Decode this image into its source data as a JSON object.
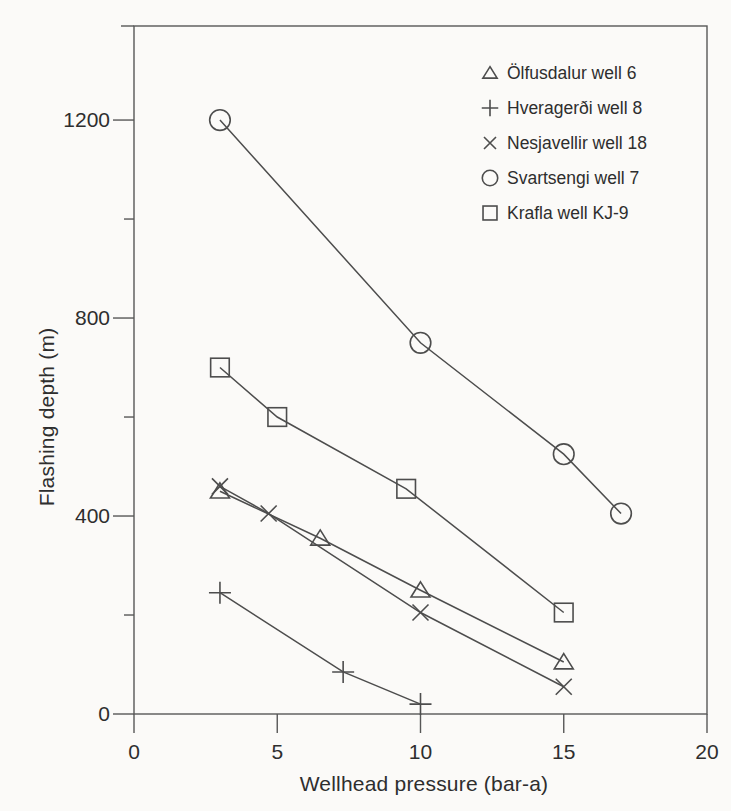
{
  "figure": {
    "background": "#fbfaf8"
  },
  "chart_data": {
    "type": "line",
    "title": "",
    "xlabel": "Wellhead pressure (bar-a)",
    "ylabel": "Flashing depth (m)",
    "xlim": [
      0,
      20
    ],
    "ylim": [
      0,
      1390
    ],
    "x_ticks": [
      0,
      5,
      10,
      15,
      20
    ],
    "y_ticks_major": [
      0,
      400,
      800,
      1200
    ],
    "y_ticks_minor": [
      200,
      600,
      1000
    ],
    "grid": false,
    "legend_position": "top-right",
    "series": [
      {
        "name": "Ölfusdalur well 6",
        "marker": "triangle",
        "points": [
          [
            3,
            450
          ],
          [
            6.5,
            355
          ],
          [
            10,
            250
          ],
          [
            15,
            105
          ]
        ]
      },
      {
        "name": "Hveragerði well 8",
        "marker": "plus",
        "points": [
          [
            3,
            245
          ],
          [
            7.3,
            85
          ],
          [
            10,
            20
          ]
        ]
      },
      {
        "name": "Nesjavellir well 18",
        "marker": "x",
        "points": [
          [
            3,
            460
          ],
          [
            4.7,
            405
          ],
          [
            10,
            205
          ],
          [
            15,
            55
          ]
        ]
      },
      {
        "name": "Svartsengi well 7",
        "marker": "circle",
        "points": [
          [
            3,
            1200
          ],
          [
            10,
            750
          ],
          [
            15,
            525
          ],
          [
            17,
            405
          ]
        ]
      },
      {
        "name": "Krafla well KJ-9",
        "marker": "square",
        "points": [
          [
            3,
            700
          ],
          [
            5,
            600
          ],
          [
            9.5,
            455
          ],
          [
            15,
            205
          ]
        ]
      }
    ],
    "colors": {
      "line": "#4d4d4d",
      "frame": "#575757",
      "text": "#2e2e2e",
      "background": "#fbfaf8"
    }
  }
}
